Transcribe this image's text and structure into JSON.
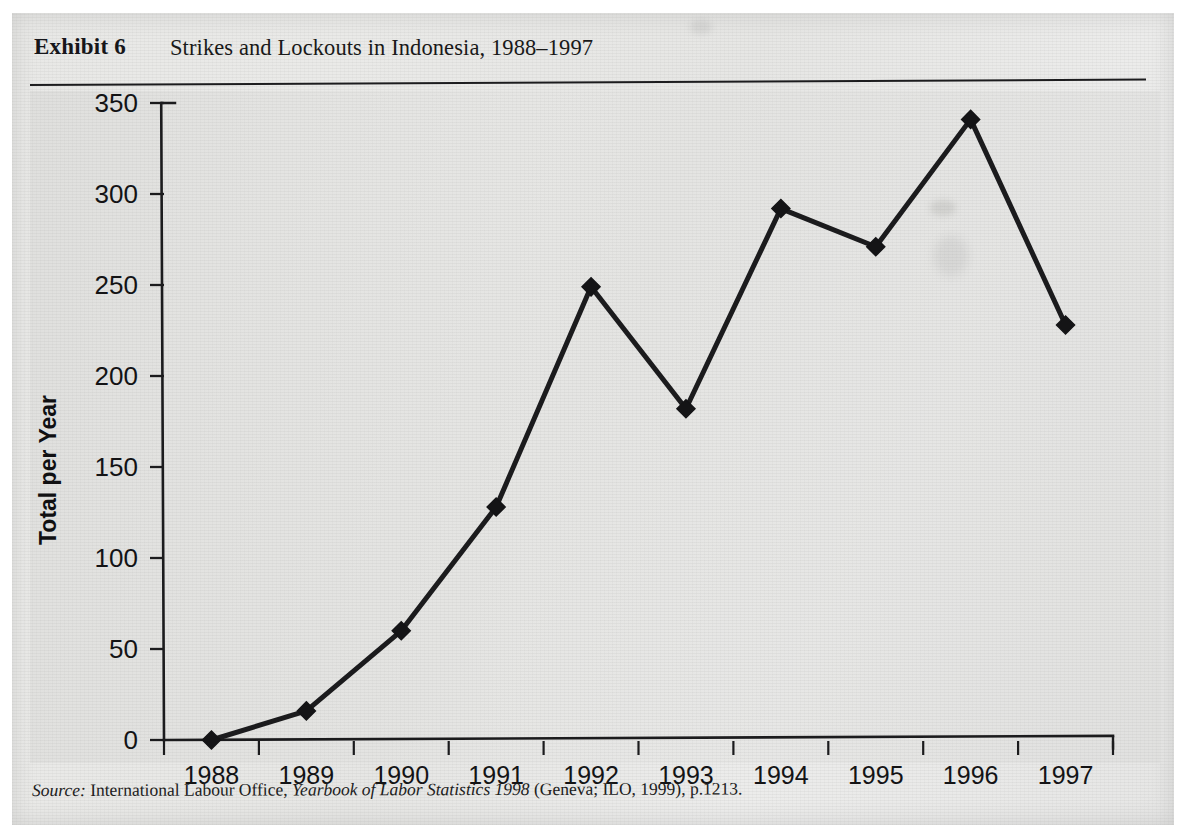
{
  "figure": {
    "exhibit_label": "Exhibit 6",
    "title": "Strikes and Lockouts in Indonesia, 1988–1997",
    "source_lead": "Source:",
    "source_publisher": "International Labour Office,",
    "source_work": "Yearbook of Labor Statistics 1998",
    "source_tail": "(Geneva; ILO, 1999), p.1213.",
    "ink_color": "#1b1b1d",
    "paper_color": "#e9e9e7"
  },
  "chart_data": {
    "type": "line",
    "title": "Strikes and Lockouts in Indonesia, 1988–1997",
    "xlabel": "",
    "ylabel": "Total per Year",
    "categories": [
      "1988",
      "1989",
      "1990",
      "1991",
      "1992",
      "1993",
      "1994",
      "1995",
      "1996",
      "1997"
    ],
    "values": [
      0,
      16,
      60,
      128,
      249,
      182,
      292,
      271,
      341,
      228
    ],
    "series": [
      {
        "name": "Total per Year",
        "values": [
          0,
          16,
          60,
          128,
          249,
          182,
          292,
          271,
          341,
          228
        ]
      }
    ],
    "ylim": [
      0,
      350
    ],
    "yticks": [
      0,
      50,
      100,
      150,
      200,
      250,
      300,
      350
    ],
    "ytick_labels": [
      "0",
      "50",
      "100",
      "150",
      "200",
      "250",
      "300",
      "350"
    ],
    "xtick_labels": [
      "1988",
      "1989",
      "1990",
      "1991",
      "1992",
      "1993",
      "1994",
      "1995",
      "1996",
      "1997"
    ],
    "grid": false,
    "legend": "none",
    "marker": "diamond",
    "line_color": "#1b1b1d",
    "marker_color": "#141416"
  },
  "axis": {
    "y_title": "Total per Year"
  }
}
